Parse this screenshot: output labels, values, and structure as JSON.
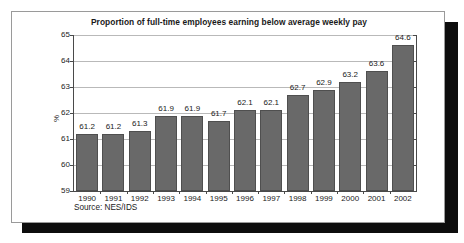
{
  "chart_data": {
    "type": "bar",
    "title": "Proportion of full-time employees earning below average weekly pay",
    "xlabel": "",
    "ylabel": "%",
    "ylim": [
      59,
      65
    ],
    "yticks": [
      59,
      60,
      61,
      62,
      63,
      64,
      65
    ],
    "ytick_labels": [
      "59",
      "60",
      "61",
      "62",
      "63",
      "64",
      "65"
    ],
    "grid": true,
    "legend": null,
    "bar_color": "#696969",
    "categories": [
      "1990",
      "1991",
      "1992",
      "1993",
      "1994",
      "1995",
      "1996",
      "1997",
      "1998",
      "1999",
      "2000",
      "2001",
      "2002"
    ],
    "values": [
      61.2,
      61.2,
      61.3,
      61.9,
      61.9,
      61.7,
      62.1,
      62.1,
      62.7,
      62.9,
      63.2,
      63.6,
      64.6
    ],
    "value_labels": [
      "61.2",
      "61.2",
      "61.3",
      "61.9",
      "61.9",
      "61.7",
      "62.1",
      "62.1",
      "62.7",
      "62.9",
      "63.2",
      "63.6",
      "64.6"
    ],
    "source_note": "Source: NES/IDS"
  }
}
